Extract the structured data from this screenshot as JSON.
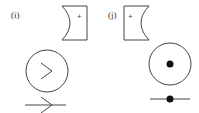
{
  "panels": [
    {
      "label": "(i)",
      "symbol": "+",
      "direction": "arrow",
      "circle_glyph": ">"
    },
    {
      "label": "(j)",
      "symbol": "+",
      "direction": "dot",
      "circle_glyph": "•"
    }
  ]
}
